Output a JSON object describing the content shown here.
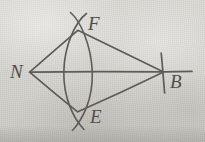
{
  "figure": {
    "background_color": "#d5d3ce",
    "ink_color": "#5c5b58",
    "canvas": {
      "width": 205,
      "height": 142
    },
    "points": [
      {
        "id": "N",
        "label": "N",
        "x": 30,
        "y": 72,
        "label_x": 10,
        "label_y": 62
      },
      {
        "id": "F",
        "label": "F",
        "x": 78,
        "y": 30,
        "label_x": 88,
        "label_y": 14
      },
      {
        "id": "E",
        "label": "E",
        "x": 78,
        "y": 112,
        "label_x": 90,
        "label_y": 107
      },
      {
        "id": "B",
        "label": "B",
        "x": 163,
        "y": 72,
        "label_x": 170,
        "label_y": 72
      }
    ],
    "segments": [
      {
        "name": "segment-N-B-baseline",
        "from": "N",
        "to": "B",
        "extends_past_to": 192
      },
      {
        "name": "segment-N-F",
        "from": "N",
        "to": "F"
      },
      {
        "name": "segment-N-E",
        "from": "N",
        "to": "E"
      },
      {
        "name": "segment-F-B",
        "from": "F",
        "to": "B"
      },
      {
        "name": "segment-E-B",
        "from": "E",
        "to": "B"
      }
    ],
    "arcs": [
      {
        "name": "arc-left-bulge",
        "from": "F",
        "to": "E",
        "mid_x": 64,
        "bulges": "left"
      },
      {
        "name": "arc-right-bulge",
        "from": "F",
        "to": "E",
        "mid_x": 92,
        "bulges": "right"
      }
    ],
    "tick": {
      "name": "tick-at-B",
      "x": 163,
      "y_top": 53,
      "y_bottom": 93
    }
  }
}
